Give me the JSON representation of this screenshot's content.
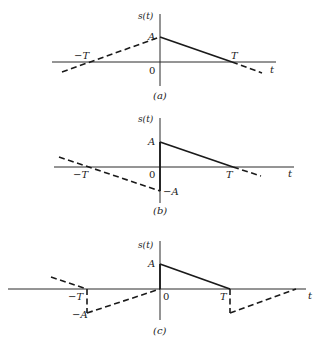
{
  "figure": {
    "panels": [
      {
        "id": "a",
        "caption": "(a)",
        "y_axis_label": "s(t)",
        "x_axis_label": "t",
        "origin_label": "0",
        "labels": {
          "amp": "A",
          "neg_T": "−T",
          "pos_T": "T"
        },
        "description": "Triangular ramp from A at t=0 decreasing to 0 at t=T (solid), extended dashed symmetric ramp rising from -T to A"
      },
      {
        "id": "b",
        "caption": "(b)",
        "y_axis_label": "s(t)",
        "x_axis_label": "t",
        "origin_label": "0",
        "labels": {
          "amp": "A",
          "neg_amp": "−A",
          "neg_T": "−T",
          "pos_T": "T"
        },
        "description": "Solid ramp from A at t=0 to 0 at t=T; odd extension dashed from 0 at -T down to -A at t=0"
      },
      {
        "id": "c",
        "caption": "(c)",
        "y_axis_label": "s(t)",
        "x_axis_label": "t",
        "origin_label": "0",
        "labels": {
          "amp": "A",
          "neg_amp": "−A",
          "neg_T": "−T",
          "pos_T": "T"
        },
        "description": "Solid ramp from A at 0 to 0 at T; dashed periodic odd extension with jumps to -A at -T and T"
      }
    ]
  }
}
